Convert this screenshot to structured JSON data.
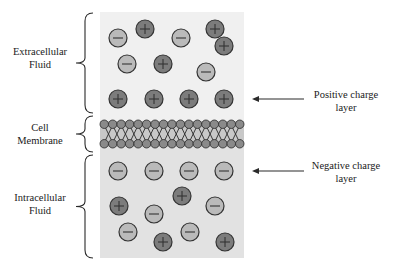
{
  "colors": {
    "extracellular_bg": "#f0f0f0",
    "intracellular_bg": "#e2e2e2",
    "positive_ion_fill": "#7c7c7c",
    "negative_ion_fill": "#bababa",
    "ion_stroke": "#333333",
    "membrane_head_fill": "#8a8a8a",
    "membrane_bg": "#c8c8c8",
    "line": "#2a2a2a"
  },
  "labels": {
    "extracellular": [
      "Extracellular",
      "Fluid"
    ],
    "membrane": [
      "Cell",
      "Membrane"
    ],
    "intracellular": [
      "Intracellular",
      "Fluid"
    ],
    "positive_layer": [
      "Positive charge",
      "layer"
    ],
    "negative_layer": [
      "Negative charge",
      "layer"
    ]
  },
  "ions": {
    "extracellular": [
      {
        "type": "-",
        "x": 118,
        "y": 38
      },
      {
        "type": "+",
        "x": 145,
        "y": 29
      },
      {
        "type": "-",
        "x": 181,
        "y": 38
      },
      {
        "type": "+",
        "x": 215,
        "y": 29
      },
      {
        "type": "+",
        "x": 224,
        "y": 46
      },
      {
        "type": "-",
        "x": 127,
        "y": 64
      },
      {
        "type": "+",
        "x": 163,
        "y": 64
      },
      {
        "type": "-",
        "x": 206,
        "y": 72
      },
      {
        "type": "+",
        "x": 118,
        "y": 99
      },
      {
        "type": "+",
        "x": 154,
        "y": 99
      },
      {
        "type": "+",
        "x": 189,
        "y": 99
      },
      {
        "type": "+",
        "x": 224,
        "y": 99
      }
    ],
    "intracellular": [
      {
        "type": "-",
        "x": 118,
        "y": 171
      },
      {
        "type": "-",
        "x": 154,
        "y": 171
      },
      {
        "type": "-",
        "x": 189,
        "y": 171
      },
      {
        "type": "-",
        "x": 224,
        "y": 171
      },
      {
        "type": "+",
        "x": 182,
        "y": 196
      },
      {
        "type": "+",
        "x": 119,
        "y": 206
      },
      {
        "type": "-",
        "x": 154,
        "y": 214
      },
      {
        "type": "-",
        "x": 215,
        "y": 206
      },
      {
        "type": "-",
        "x": 128,
        "y": 232
      },
      {
        "type": "+",
        "x": 163,
        "y": 242
      },
      {
        "type": "-",
        "x": 190,
        "y": 232
      },
      {
        "type": "+",
        "x": 225,
        "y": 242
      }
    ]
  },
  "membrane": {
    "x_start": 100,
    "x_end": 244,
    "top_y": 121,
    "bottom_y": 147,
    "head_count": 17
  },
  "arrows": [
    {
      "name": "positive-layer-arrow",
      "y": 99,
      "x_from": 304,
      "x_to": 252
    },
    {
      "name": "negative-layer-arrow",
      "y": 171,
      "x_from": 304,
      "x_to": 252
    }
  ]
}
